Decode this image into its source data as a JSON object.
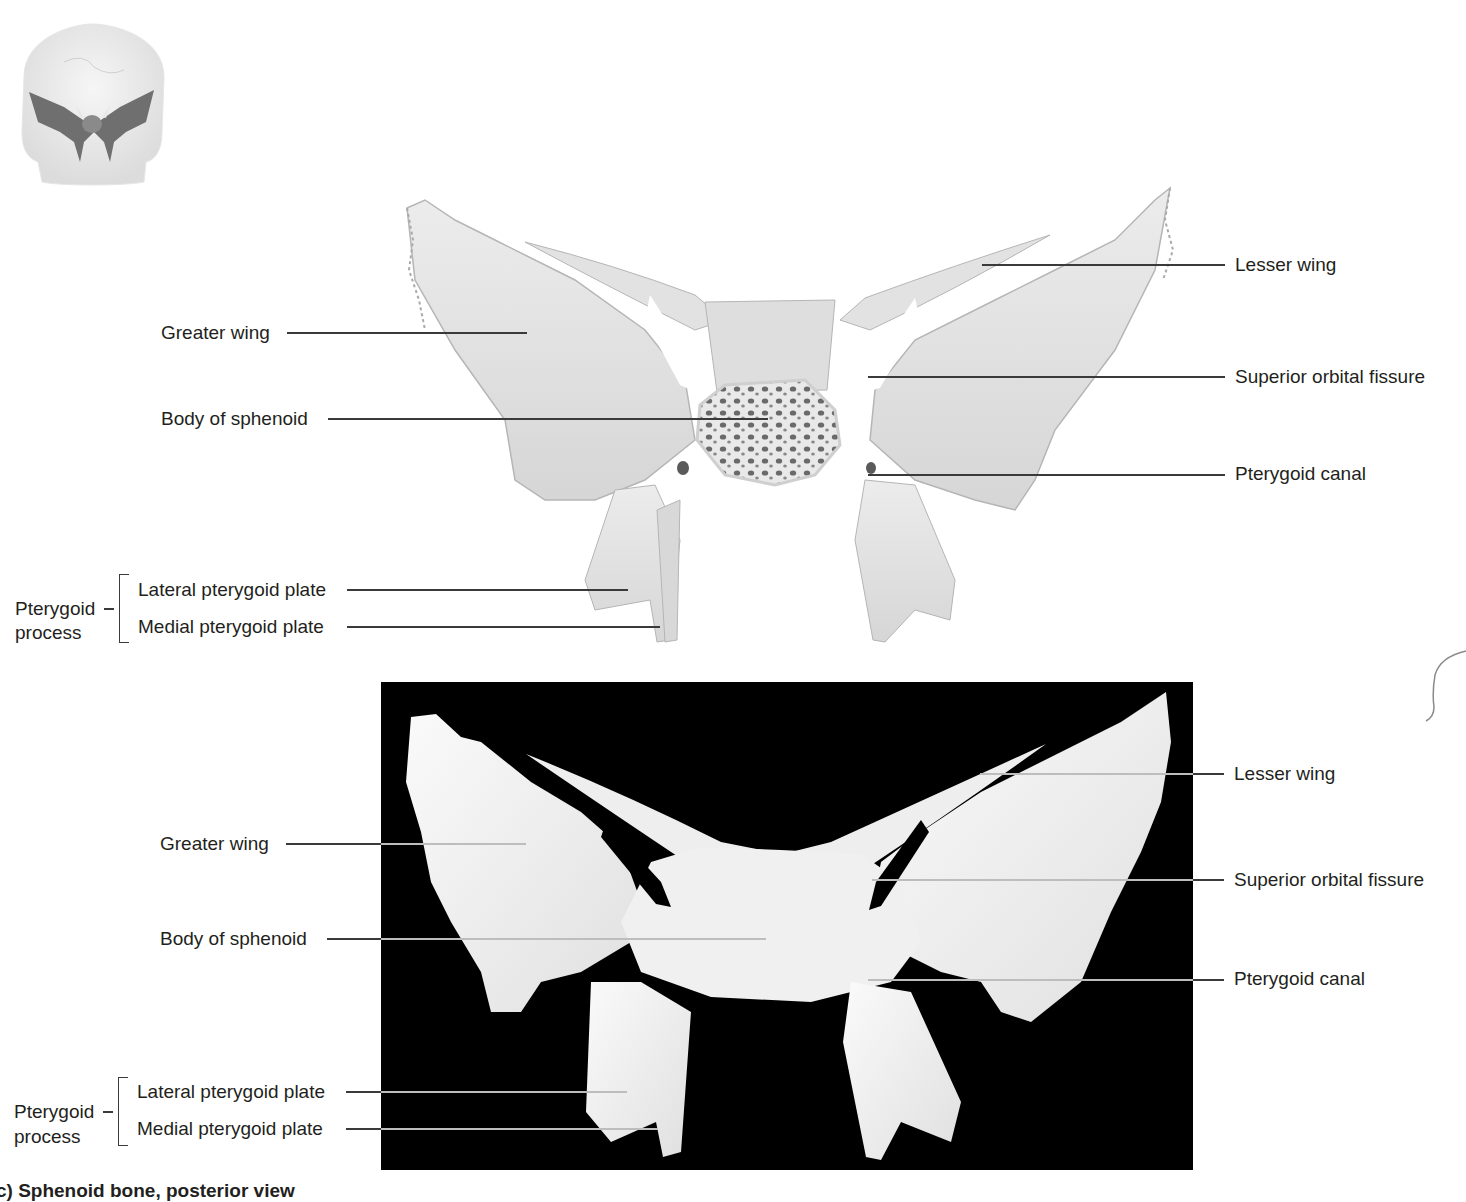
{
  "figure": {
    "caption": "c) Sphenoid bone, posterior view",
    "orientation_thumbnail": {
      "description": "skull-orientation-thumbnail"
    }
  },
  "illustration_panel": {
    "type": "drawing",
    "labels_left": {
      "greater_wing": "Greater wing",
      "body_of_sphenoid": "Body of sphenoid",
      "pterygoid_process": "Pterygoid process",
      "pterygoid_process_line1": "Pterygoid",
      "pterygoid_process_line2": "process",
      "lateral_pterygoid_plate": "Lateral pterygoid plate",
      "medial_pterygoid_plate": "Medial pterygoid plate"
    },
    "labels_right": {
      "lesser_wing": "Lesser wing",
      "superior_orbital_fissure": "Superior orbital fissure",
      "pterygoid_canal": "Pterygoid canal"
    }
  },
  "photo_panel": {
    "type": "photograph",
    "background": "#000000",
    "labels_left": {
      "greater_wing": "Greater wing",
      "body_of_sphenoid": "Body of sphenoid",
      "pterygoid_process_line1": "Pterygoid",
      "pterygoid_process_line2": "process",
      "lateral_pterygoid_plate": "Lateral pterygoid plate",
      "medial_pterygoid_plate": "Medial pterygoid plate"
    },
    "labels_right": {
      "lesser_wing": "Lesser wing",
      "superior_orbital_fissure": "Superior orbital fissure",
      "pterygoid_canal": "Pterygoid canal"
    }
  },
  "colors": {
    "text": "#231f20",
    "leader_line": "#3a3a3a",
    "bone_drawing": "#e4e4e4",
    "bone_shadow": "#bfbfbf",
    "bone_photo": "#f2f2f2",
    "photo_background": "#000000"
  }
}
